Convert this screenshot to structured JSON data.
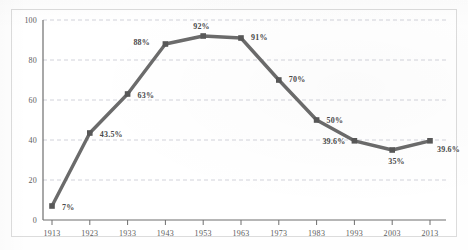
{
  "chart_data": {
    "type": "line",
    "title": "",
    "subtitle": "",
    "xlabel": "",
    "ylabel": "",
    "categories": [
      "1913",
      "1923",
      "1933",
      "1943",
      "1953",
      "1963",
      "1973",
      "1983",
      "1993",
      "2003",
      "2013"
    ],
    "values": [
      7,
      43.5,
      63,
      88,
      92,
      91,
      70,
      50,
      39.6,
      35,
      39.6
    ],
    "point_labels": [
      "7%",
      "43.5%",
      "63%",
      "88%",
      "92%",
      "91%",
      "70%",
      "50%",
      "39.6%",
      "35%",
      "39.6%"
    ],
    "series": [
      {
        "name": "",
        "values": [
          7,
          43.5,
          63,
          88,
          92,
          91,
          70,
          50,
          39.6,
          35,
          39.6
        ]
      }
    ],
    "ylim": [
      0,
      100
    ],
    "y_ticks": [
      0,
      20,
      40,
      60,
      80,
      100
    ],
    "y_tick_labels": [
      "0",
      "20",
      "40",
      "60",
      "80",
      "100"
    ],
    "x_tick_labels": [
      "1913",
      "1923",
      "1933",
      "1943",
      "1953",
      "1963",
      "1973",
      "1983",
      "1993",
      "2003",
      "2013"
    ],
    "grid": "horizontal-dashed",
    "legend": "none",
    "marker": "square",
    "colors": {
      "line": "#6b6b6b",
      "marker": "#585858",
      "grid": "#c9ccd4",
      "axis": "#6e6e6e",
      "label_text": "#4a4a4a",
      "tick_text": "#5c5c5c",
      "background": "#ffffff",
      "frame": "#dcdcdc"
    },
    "label_offsets": [
      {
        "dx": 10,
        "dy": 4
      },
      {
        "dx": 10,
        "dy": 4
      },
      {
        "dx": 10,
        "dy": 4
      },
      {
        "dx": -32,
        "dy": 1
      },
      {
        "dx": -10,
        "dy": -7
      },
      {
        "dx": 10,
        "dy": 2
      },
      {
        "dx": 10,
        "dy": 2
      },
      {
        "dx": 10,
        "dy": 3
      },
      {
        "dx": -32,
        "dy": 3
      },
      {
        "dx": -4,
        "dy": 14
      },
      {
        "dx": 7,
        "dy": 11
      }
    ]
  }
}
